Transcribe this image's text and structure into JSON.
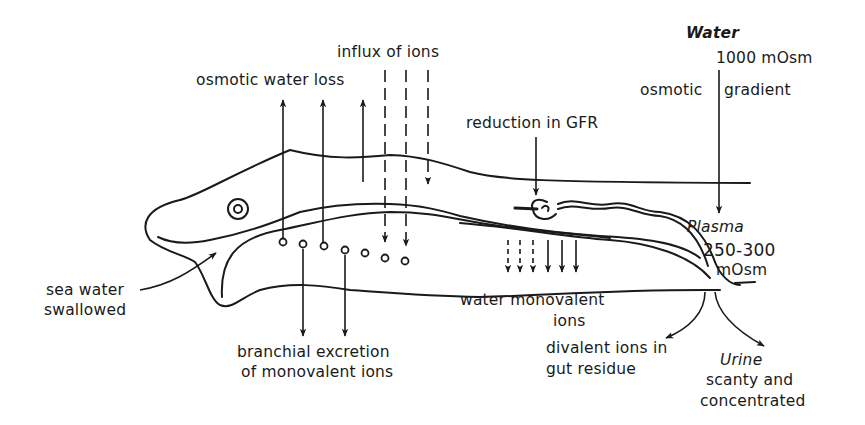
{
  "diagram": {
    "stroke_color": "#1a1a1a",
    "background": "#ffffff",
    "labels": {
      "influx_of_ions": "influx of ions",
      "osmotic_water_loss": "osmotic water loss",
      "reduction_in_gfr": "reduction in GFR",
      "water_label": "Water",
      "water_concentration": "1000 mOsm",
      "osmotic_left": "osmotic",
      "gradient_right": "gradient",
      "plasma_label": "Plasma",
      "plasma_concentration_1": "250-300",
      "plasma_concentration_2": "mOsm",
      "sea_water_1": "sea water",
      "sea_water_2": "swallowed",
      "gut_absorption_1": "water monovalent",
      "gut_absorption_2": "ions",
      "branchial_1": "branchial excretion",
      "branchial_2": "of monovalent ions",
      "divalent_1": "divalent ions in",
      "divalent_2": "gut residue",
      "urine_label": "Urine",
      "urine_desc_1": "scanty and",
      "urine_desc_2": "concentrated"
    },
    "arrows": {
      "osmotic_water_loss_count": 3,
      "influx_of_ions_count": 3,
      "branchial_excretion_count": 2,
      "gut_absorption_count": 6,
      "gill_openings_count": 7
    }
  }
}
